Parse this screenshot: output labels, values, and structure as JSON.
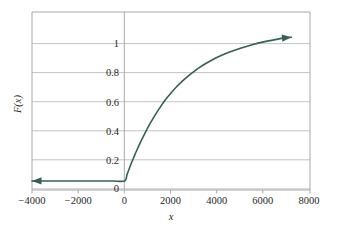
{
  "chart_data": {
    "type": "line",
    "title": "",
    "subtitle": "",
    "xlabel": "x",
    "ylabel": "F(x)",
    "xlim": [
      -4000,
      8000
    ],
    "ylim": [
      -0.06,
      1.12
    ],
    "grid": "horizontal",
    "legend": "none",
    "x_ticks": [
      -4000,
      -2000,
      0,
      2000,
      4000,
      6000,
      8000
    ],
    "x_tick_labels": [
      "−4000",
      "−2000",
      "0",
      "2000",
      "4000",
      "6000",
      "8000"
    ],
    "y_ticks": [
      0,
      0.2,
      0.4,
      0.6,
      0.8,
      1
    ],
    "y_tick_labels": [
      "0",
      "0.2",
      "0.4",
      "0.6",
      "0.8",
      "1"
    ],
    "series": [
      {
        "name": "F(x) = 1 - exp(-x/2300)",
        "color": "#355f57",
        "linewidth": 1.6,
        "arrow_start": true,
        "arrow_end": true,
        "x": [
          -4000,
          -3000,
          -2000,
          -1000,
          -500,
          0,
          100,
          200,
          300,
          400,
          500,
          700,
          900,
          1100,
          1300,
          1500,
          1750,
          2000,
          2250,
          2500,
          2750,
          3000,
          3250,
          3500,
          3750,
          4000,
          4500,
          5000,
          5500,
          6000,
          6500,
          7000,
          7200
        ],
        "y": [
          0,
          0,
          0,
          0,
          0,
          0,
          0.042,
          0.083,
          0.122,
          0.159,
          0.195,
          0.262,
          0.324,
          0.381,
          0.433,
          0.481,
          0.536,
          0.583,
          0.626,
          0.663,
          0.697,
          0.727,
          0.754,
          0.779,
          0.8,
          0.82,
          0.853,
          0.88,
          0.903,
          0.922,
          0.937,
          0.95,
          0.953
        ]
      }
    ],
    "annotations": [
      {
        "name": "y-axis-vertical-line",
        "x": 0,
        "type": "vline"
      }
    ],
    "colors": {
      "curve": "#355f57",
      "grid": "#b9b9b9",
      "frame": "#a8a8a8",
      "background": "#ffffff",
      "text": "#1f1f1f"
    }
  }
}
